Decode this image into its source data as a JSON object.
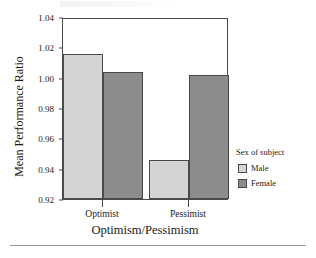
{
  "chart_data": {
    "type": "bar",
    "title": "",
    "xlabel": "Optimism/Pessimism",
    "ylabel": "Mean Performance Ratio",
    "categories": [
      "Optimist",
      "Pessimist"
    ],
    "series": [
      {
        "name": "Male",
        "values": [
          1.017,
          0.946
        ],
        "color": "#d4d4d4"
      },
      {
        "name": "Female",
        "values": [
          1.005,
          1.003
        ],
        "color": "#8c8c8c"
      }
    ],
    "ylim": [
      0.92,
      1.04
    ],
    "ytick_labels": [
      "1.04",
      "1.02",
      "1.00",
      "0.98",
      "0.96",
      "0.94",
      "0.92"
    ],
    "ytick_values": [
      1.04,
      1.02,
      1.0,
      0.98,
      0.96,
      0.94,
      0.92
    ],
    "grid": false,
    "legend_position": "right",
    "legend_title": "Sex of subject"
  },
  "legend": {
    "title": "Sex of subject",
    "entries": [
      {
        "label": "Male",
        "color": "#d4d4d4"
      },
      {
        "label": "Female",
        "color": "#8c8c8c"
      }
    ]
  },
  "axes": {
    "y_title": "Mean Performance Ratio",
    "x_title": "Optimism/Pessimism",
    "y_ticks": [
      "1.04",
      "1.02",
      "1.00",
      "0.98",
      "0.96",
      "0.94",
      "0.92"
    ],
    "x_ticks": [
      "Optimist",
      "Pessimist"
    ]
  }
}
